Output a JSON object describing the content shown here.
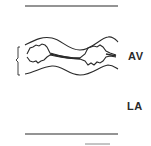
{
  "diagram": {
    "type": "M-mode echocardiogram schematic",
    "labels": {
      "av": "AV",
      "la": "LA"
    },
    "colors": {
      "line": "#2a2a2a",
      "background": "#ffffff"
    }
  }
}
